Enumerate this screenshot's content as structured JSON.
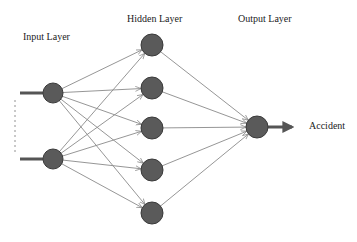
{
  "labels": {
    "input_layer": "Input Layer",
    "hidden_layer": "Hidden Layer",
    "output_layer": "Output Layer",
    "output_name": "Accident"
  },
  "colors": {
    "node_fill": "#5a5a5a",
    "node_stroke": "#3a3a3a",
    "edge": "#8a8a8a",
    "io_arrow": "#555555",
    "text": "#222222"
  },
  "network": {
    "input_nodes": [
      {
        "x": 53,
        "y": 93
      },
      {
        "x": 53,
        "y": 159
      }
    ],
    "hidden_nodes": [
      {
        "x": 152,
        "y": 45
      },
      {
        "x": 152,
        "y": 88
      },
      {
        "x": 152,
        "y": 128
      },
      {
        "x": 152,
        "y": 170
      },
      {
        "x": 152,
        "y": 213
      }
    ],
    "output_nodes": [
      {
        "x": 257,
        "y": 127
      }
    ],
    "input_radius": 10,
    "hidden_radius": 11,
    "output_radius": 11
  }
}
